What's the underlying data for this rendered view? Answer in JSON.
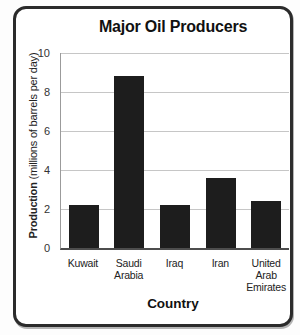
{
  "chart_data": {
    "type": "bar",
    "title": "Major Oil Producers",
    "categories": [
      "Kuwait",
      "Saudi Arabia",
      "Iraq",
      "Iran",
      "United Arab Emirates"
    ],
    "categories_display": [
      "Kuwait",
      "Saudi\nArabia",
      "Iraq",
      "Iran",
      "United\nArab\nEmirates"
    ],
    "values": [
      2.2,
      8.8,
      2.2,
      3.6,
      2.4
    ],
    "xlabel": "Country",
    "ylabel": "Production (millions of barrels per day)",
    "ylabel_main": "Production",
    "ylabel_sub": " (millions of barrels per day)",
    "ylim": [
      0,
      10
    ],
    "yticks": [
      0,
      2,
      4,
      6,
      8,
      10
    ],
    "grid": "horizontal-only",
    "legend": "none",
    "colors": {
      "bar": "#1d1d1d",
      "gridline": "#c6c6c6",
      "axis": "#4d4d4d",
      "card_border": "#2b2b2b",
      "text": "#222222"
    }
  }
}
